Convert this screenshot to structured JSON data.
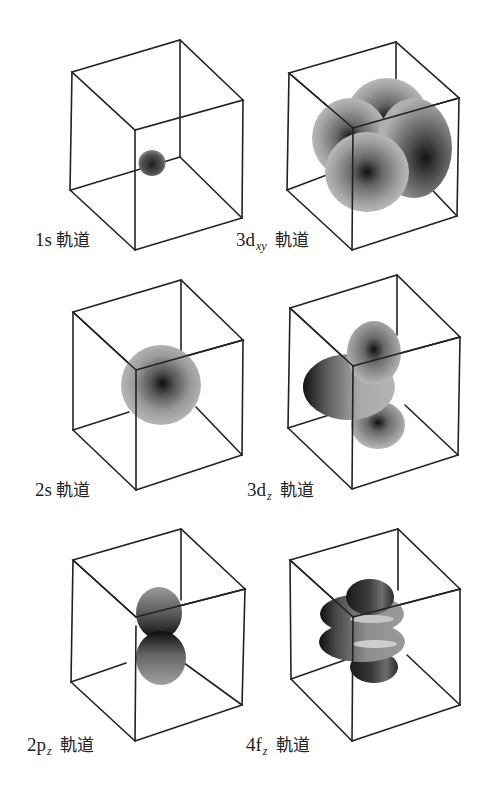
{
  "figure": {
    "panels": [
      {
        "id": "1s",
        "main": "1s",
        "sub": "",
        "suffix": "軌道",
        "shape": "small-sphere"
      },
      {
        "id": "3dxy",
        "main": "3d",
        "sub": "xy",
        "suffix": "軌道",
        "shape": "four-lobes"
      },
      {
        "id": "2s",
        "main": "2s",
        "sub": "",
        "suffix": "軌道",
        "shape": "large-sphere"
      },
      {
        "id": "3dz",
        "main": "3d",
        "sub": "z",
        "suffix": "軌道",
        "shape": "two-lobes-with-torus"
      },
      {
        "id": "2pz",
        "main": "2p",
        "sub": "z",
        "suffix": "軌道",
        "shape": "two-lobes"
      },
      {
        "id": "4fz",
        "main": "4f",
        "sub": "z",
        "suffix": "軌道",
        "shape": "two-lobes-with-two-tori"
      }
    ],
    "colors": {
      "edge": "#222222",
      "lobe_light": "#b5b5b5",
      "lobe_dark": "#1a1a1a",
      "background": "#ffffff"
    }
  }
}
